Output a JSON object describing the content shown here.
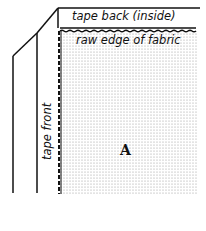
{
  "diagram": {
    "labels": {
      "tape_back": "tape back (inside)",
      "raw_edge": "raw edge of fabric",
      "tape_front": "tape front",
      "region": "A"
    },
    "colors": {
      "line": "#111111",
      "background": "#ffffff",
      "fabric_dots": "#9a9a9a"
    }
  }
}
